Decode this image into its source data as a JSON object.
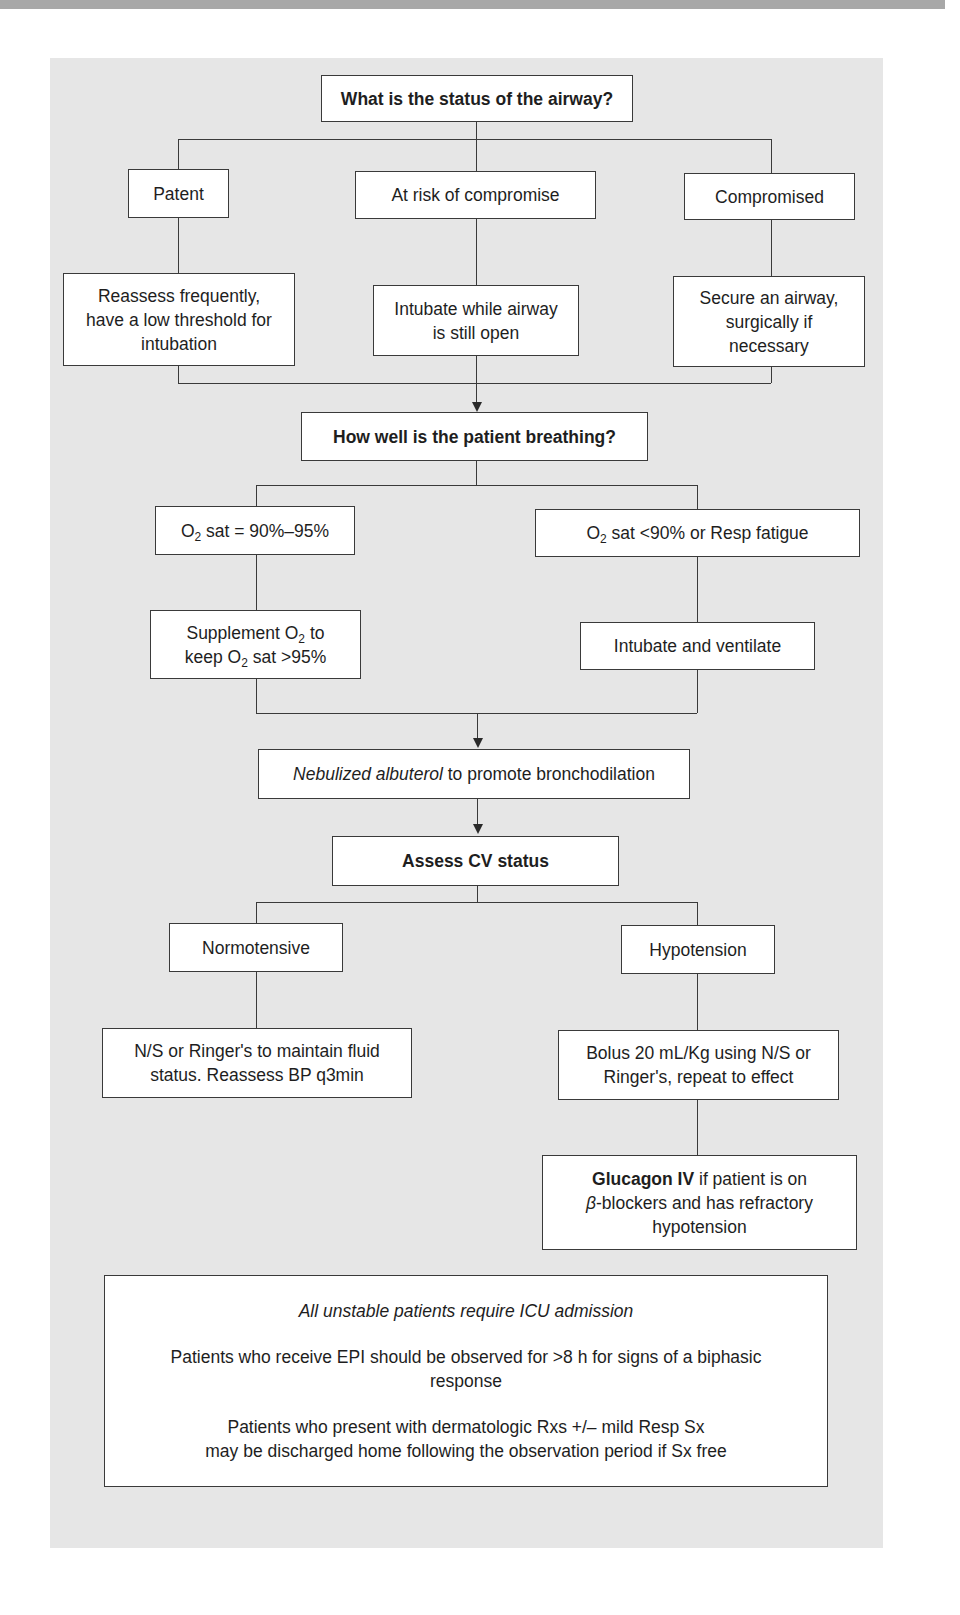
{
  "flowchart": {
    "airway": {
      "question": "What is the status of the airway?",
      "branches": [
        {
          "status": "Patent",
          "action": "Reassess frequently, have a low threshold for intubation"
        },
        {
          "status": "At risk of compromise",
          "action": "Intubate while airway is still open"
        },
        {
          "status": "Compromised",
          "action": "Secure an airway, surgically if necessary"
        }
      ]
    },
    "breathing": {
      "question": "How well is the patient breathing?",
      "branches": [
        {
          "status_prefix": "O",
          "status_sub": "2",
          "status_suffix": " sat = 90%–95%",
          "action_l1_prefix": "Supplement O",
          "action_l1_sub": "2",
          "action_l1_suffix": " to",
          "action_l2_prefix": "keep O",
          "action_l2_sub": "2",
          "action_l2_suffix": " sat >95%"
        },
        {
          "status_prefix": "O",
          "status_sub": "2",
          "status_suffix": " sat <90% or Resp fatigue",
          "action": "Intubate and ventilate"
        }
      ]
    },
    "bronchodilation": {
      "drug": "Nebulized albuterol",
      "text": " to promote bronchodilation"
    },
    "cv": {
      "question": "Assess CV status",
      "branches": [
        {
          "status": "Normotensive",
          "action": "N/S or Ringer's to maintain fluid status. Reassess BP q3min"
        },
        {
          "status": "Hypotension",
          "action": "Bolus 20 mL/Kg using N/S or Ringer's, repeat to effect",
          "followup_bold": "Glucagon IV",
          "followup_l1": " if patient is on",
          "followup_beta": "β",
          "followup_l2": "-blockers and has refractory",
          "followup_l3": "hypotension"
        }
      ]
    },
    "notes": [
      "All unstable patients require ICU admission",
      "Patients who receive EPI should be observed for >8 h for signs of a biphasic response",
      "Patients who present with dermatologic Rxs +/– mild Resp Sx",
      "may be discharged home following the observation period if Sx free"
    ]
  }
}
